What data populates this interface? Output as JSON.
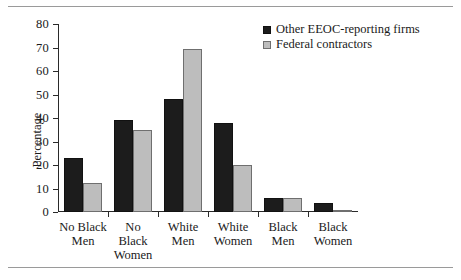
{
  "chart_data": {
    "type": "bar",
    "title": "",
    "xlabel": "",
    "ylabel": "Percentage",
    "ylim": [
      0,
      80
    ],
    "ytick_step": 10,
    "yticks": [
      "0",
      "10",
      "20",
      "30",
      "40",
      "50",
      "60",
      "70",
      "80"
    ],
    "grid": false,
    "legend_position": "top-right",
    "categories": [
      "No Black\nMen",
      "No\nBlack\nWomen",
      "White\nMen",
      "White\nWomen",
      "Black\nMen",
      "Black\nWomen"
    ],
    "series": [
      {
        "name": "Other EEOC-reporting firms",
        "color": "#1c1c1c",
        "values": [
          23,
          39,
          48,
          38,
          6,
          4
        ]
      },
      {
        "name": "Federal contractors",
        "color": "#bdbdbd",
        "values": [
          12.5,
          35,
          69.5,
          20,
          6,
          1
        ]
      }
    ]
  },
  "legend": {
    "items": [
      {
        "label": "Other EEOC-reporting firms",
        "swatch": "black-square-icon"
      },
      {
        "label": "Federal contractors",
        "swatch": "gray-square-icon"
      }
    ]
  }
}
